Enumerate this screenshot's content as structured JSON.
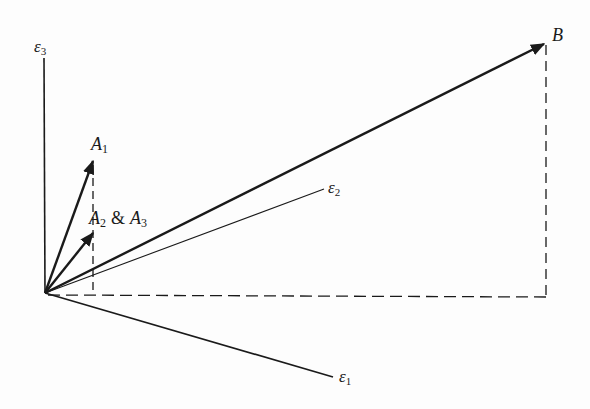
{
  "diagram": {
    "type": "vector-diagram",
    "origin": [
      45,
      293
    ],
    "axes": [
      {
        "id": "e3",
        "symbol": "ε",
        "subscript": "3",
        "end": [
          44,
          58
        ],
        "label_pos": [
          34,
          52
        ]
      },
      {
        "id": "e2",
        "symbol": "ε",
        "subscript": "2",
        "end": [
          324,
          189
        ],
        "label_pos": [
          328,
          193
        ]
      },
      {
        "id": "e1",
        "symbol": "ε",
        "subscript": "1",
        "end": [
          333,
          377
        ],
        "label_pos": [
          339,
          384
        ]
      }
    ],
    "vectors": [
      {
        "id": "A1",
        "label": "A",
        "subscript": "1",
        "tip": [
          94,
          159
        ],
        "label_pos": [
          92,
          150
        ]
      },
      {
        "id": "A2A3",
        "label": "A",
        "subscript": "2",
        "connector": " & ",
        "label2": "A",
        "subscript2": "3",
        "tip": [
          94,
          232
        ],
        "label_pos": [
          89,
          226
        ]
      },
      {
        "id": "B",
        "label": "B",
        "tip": [
          546,
          43
        ],
        "label_pos": [
          552,
          41
        ]
      }
    ],
    "projections": {
      "A_vertical_dashed": {
        "x": 93,
        "from_y": 159,
        "to_y": 295
      },
      "B_vertical_dashed": {
        "x": 546,
        "from_y": 43,
        "to_y": 297
      },
      "horizontal_dashed": {
        "y": 295,
        "from_x": 45,
        "to_x": 546
      }
    },
    "labels": {
      "e3_symbol": "ε",
      "e3_sub": "3",
      "e2_symbol": "ε",
      "e2_sub": "2",
      "e1_symbol": "ε",
      "e1_sub": "1",
      "A1_main": "A",
      "A1_sub": "1",
      "A2_main": "A",
      "A2_sub": "2",
      "amp": "&",
      "A3_main": "A",
      "A3_sub": "3",
      "B_main": "B"
    },
    "colors": {
      "ink": "#1a1a1a",
      "background": "#fdfdfd"
    }
  }
}
